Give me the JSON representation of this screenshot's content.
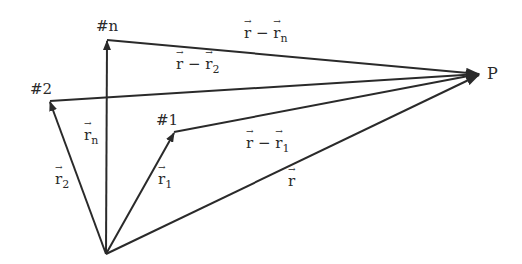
{
  "diagram": {
    "line_color": "#2a2a2a",
    "origin": {
      "x": 106,
      "y": 254
    },
    "nodes": [
      {
        "id": "n",
        "label": "#n",
        "x": 107,
        "y": 40,
        "label_x": 96,
        "label_y": 19
      },
      {
        "id": "2",
        "label": "#2",
        "x": 50,
        "y": 101,
        "label_x": 30,
        "label_y": 82
      },
      {
        "id": "1",
        "label": "#1",
        "x": 174,
        "y": 132,
        "label_x": 156,
        "label_y": 113
      },
      {
        "id": "P",
        "label": "P",
        "x": 481,
        "y": 74,
        "label_x": 486,
        "label_y": 66
      }
    ],
    "vectors": [
      {
        "name": "r_n",
        "base": "r",
        "sub": "n",
        "x": 84,
        "y": 128
      },
      {
        "name": "r_2",
        "base": "r",
        "sub": "2",
        "x": 55,
        "y": 172
      },
      {
        "name": "r_1",
        "base": "r",
        "sub": "1",
        "x": 158,
        "y": 172
      },
      {
        "name": "r",
        "base": "r",
        "sub": "",
        "x": 288,
        "y": 174
      }
    ],
    "differences": [
      {
        "name": "r_minus_rn",
        "base": "r",
        "minus": " − ",
        "sub_base": "r",
        "sub": "n",
        "x": 244,
        "y": 26
      },
      {
        "name": "r_minus_r2",
        "base": "r",
        "minus": " − ",
        "sub_base": "r",
        "sub": "2",
        "x": 176,
        "y": 57
      },
      {
        "name": "r_minus_r1",
        "base": "r",
        "minus": " − ",
        "sub_base": "r",
        "sub": "1",
        "x": 246,
        "y": 136
      }
    ]
  }
}
